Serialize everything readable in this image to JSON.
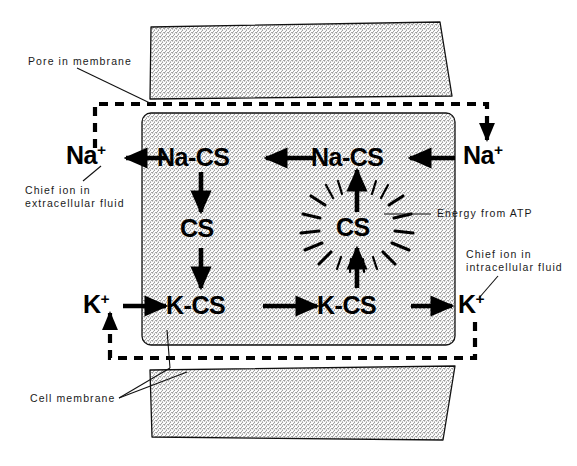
{
  "figure": {
    "background": "#ffffff",
    "ink": "#000000",
    "stipple": "#b9b9b9"
  },
  "callouts": [
    {
      "id": "pore",
      "text": "Pore in membrane",
      "lines": [
        "Pore in membrane"
      ]
    },
    {
      "id": "extracellular",
      "text": "Chief ion in extracellular fluid",
      "lines": [
        "Chief ion in",
        "extracellular fluid"
      ]
    },
    {
      "id": "atp",
      "text": "Energy from ATP",
      "lines": [
        "Energy from ATP"
      ]
    },
    {
      "id": "intracellular",
      "text": "Chief ion in intracellular fluid",
      "lines": [
        "Chief ion in",
        "intracellular fluid"
      ]
    },
    {
      "id": "cellmembrane",
      "text": "Cell membrane",
      "lines": [
        "Cell membrane"
      ]
    }
  ],
  "species": {
    "na_out_left": {
      "base": "Na",
      "charge": "+"
    },
    "na_cs_left": {
      "base": "Na-CS",
      "charge": ""
    },
    "na_cs_right": {
      "base": "Na-CS",
      "charge": ""
    },
    "na_out_right": {
      "base": "Na",
      "charge": "+"
    },
    "cs_free": {
      "base": "CS",
      "charge": ""
    },
    "cs_energized": {
      "base": "CS",
      "charge": ""
    },
    "k_out_left": {
      "base": "K",
      "charge": "+"
    },
    "k_cs_left": {
      "base": "K-CS",
      "charge": ""
    },
    "k_cs_right": {
      "base": "K-CS",
      "charge": ""
    },
    "k_out_right": {
      "base": "K",
      "charge": "+"
    }
  },
  "flow": {
    "top_row_direction": "leftward",
    "bottom_row_direction": "rightward",
    "top_sequence": [
      "Na+",
      "Na-CS",
      "Na-CS",
      "Na+"
    ],
    "bottom_sequence": [
      "K+",
      "K-CS",
      "K-CS",
      "K+"
    ],
    "carrier_cycle": [
      "Na-CS",
      "CS",
      "K-CS",
      "CS (energized)",
      "Na-CS"
    ]
  }
}
